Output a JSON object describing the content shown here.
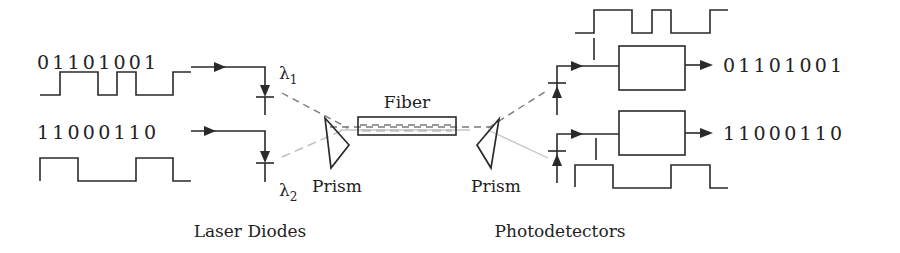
{
  "inputs": [
    {
      "bits": "01101001",
      "wavelength_symbol": "λ",
      "wavelength_index": "1",
      "waveform": [
        0,
        1,
        1,
        0,
        1,
        0,
        0,
        1
      ]
    },
    {
      "bits": "11000110",
      "wavelength_symbol": "λ",
      "wavelength_index": "2",
      "waveform": [
        1,
        1,
        0,
        0,
        0,
        1,
        1,
        0
      ]
    }
  ],
  "outputs": [
    {
      "bits": "01101001",
      "waveform": [
        0,
        1,
        1,
        0,
        1,
        0,
        0,
        1
      ]
    },
    {
      "bits": "11000110",
      "waveform": [
        1,
        1,
        0,
        0,
        0,
        1,
        1,
        0
      ]
    }
  ],
  "labels": {
    "fiber": "Fiber",
    "prism_left": "Prism",
    "prism_right": "Prism",
    "laser_diodes": "Laser Diodes",
    "photodetectors": "Photodetectors"
  },
  "colors": {
    "ink": "#2a2a2a",
    "beam_lambda1": "#7a7a7a",
    "beam_lambda2": "#bdbdbd",
    "background": "#ffffff"
  }
}
